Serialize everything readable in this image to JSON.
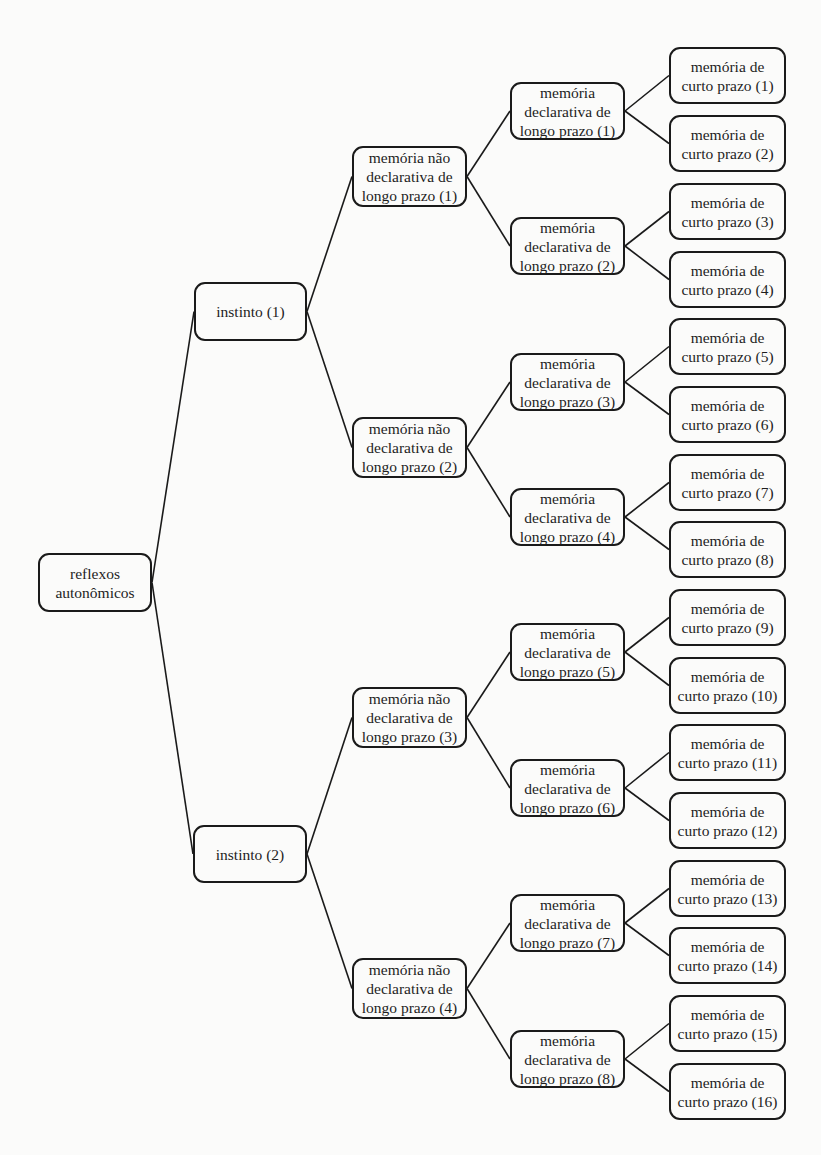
{
  "diagram": {
    "type": "tree",
    "direction": "left-to-right",
    "colors": {
      "background": "#fbfbfa",
      "border": "#1a1a1a",
      "text": "#1e1e1e",
      "edge": "#1a1a1a"
    },
    "root": {
      "id": "root",
      "label": "reflexos\nautonômicos"
    },
    "level1": [
      {
        "id": "i1",
        "label": "instinto (1)",
        "parent": "root"
      },
      {
        "id": "i2",
        "label": "instinto (2)",
        "parent": "root"
      }
    ],
    "level2": [
      {
        "id": "nd1",
        "label": "memória não\ndeclarativa de\nlongo prazo (1)",
        "parent": "i1"
      },
      {
        "id": "nd2",
        "label": "memória não\ndeclarativa de\nlongo prazo (2)",
        "parent": "i1"
      },
      {
        "id": "nd3",
        "label": "memória não\ndeclarativa de\nlongo prazo (3)",
        "parent": "i2"
      },
      {
        "id": "nd4",
        "label": "memória não\ndeclarativa de\nlongo prazo (4)",
        "parent": "i2"
      }
    ],
    "level3": [
      {
        "id": "d1",
        "label": "memória\ndeclarativa de\nlongo prazo (1)",
        "parent": "nd1"
      },
      {
        "id": "d2",
        "label": "memória\ndeclarativa de\nlongo prazo (2)",
        "parent": "nd1"
      },
      {
        "id": "d3",
        "label": "memória\ndeclarativa de\nlongo prazo (3)",
        "parent": "nd2"
      },
      {
        "id": "d4",
        "label": "memória\ndeclarativa de\nlongo prazo (4)",
        "parent": "nd2"
      },
      {
        "id": "d5",
        "label": "memória\ndeclarativa de\nlongo prazo (5)",
        "parent": "nd3"
      },
      {
        "id": "d6",
        "label": "memória\ndeclarativa de\nlongo prazo (6)",
        "parent": "nd3"
      },
      {
        "id": "d7",
        "label": "memória\ndeclarativa de\nlongo prazo (7)",
        "parent": "nd4"
      },
      {
        "id": "d8",
        "label": "memória\ndeclarativa de\nlongo prazo (8)",
        "parent": "nd4"
      }
    ],
    "level4": [
      {
        "id": "c1",
        "label": "memória de\ncurto prazo (1)",
        "parent": "d1"
      },
      {
        "id": "c2",
        "label": "memória de\ncurto prazo (2)",
        "parent": "d1"
      },
      {
        "id": "c3",
        "label": "memória de\ncurto prazo (3)",
        "parent": "d2"
      },
      {
        "id": "c4",
        "label": "memória de\ncurto prazo (4)",
        "parent": "d2"
      },
      {
        "id": "c5",
        "label": "memória de\ncurto prazo (5)",
        "parent": "d3"
      },
      {
        "id": "c6",
        "label": "memória de\ncurto prazo (6)",
        "parent": "d3"
      },
      {
        "id": "c7",
        "label": "memória de\ncurto prazo (7)",
        "parent": "d4"
      },
      {
        "id": "c8",
        "label": "memória de\ncurto prazo (8)",
        "parent": "d4"
      },
      {
        "id": "c9",
        "label": "memória de\ncurto prazo (9)",
        "parent": "d5"
      },
      {
        "id": "c10",
        "label": "memória de\ncurto prazo (10)",
        "parent": "d5"
      },
      {
        "id": "c11",
        "label": "memória de\ncurto prazo (11)",
        "parent": "d6"
      },
      {
        "id": "c12",
        "label": "memória de\ncurto prazo (12)",
        "parent": "d6"
      },
      {
        "id": "c13",
        "label": "memória de\ncurto prazo (13)",
        "parent": "d7"
      },
      {
        "id": "c14",
        "label": "memória de\ncurto prazo (14)",
        "parent": "d7"
      },
      {
        "id": "c15",
        "label": "memória de\ncurto prazo (15)",
        "parent": "d8"
      },
      {
        "id": "c16",
        "label": "memória de\ncurto prazo (16)",
        "parent": "d8"
      }
    ]
  }
}
